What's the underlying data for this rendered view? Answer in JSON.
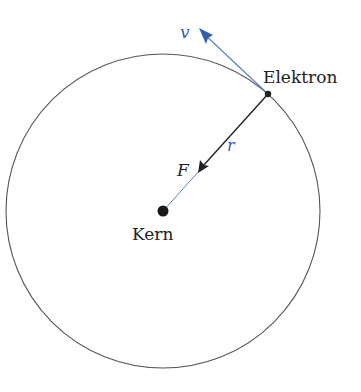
{
  "diagram": {
    "type": "bohr-atom-orbit",
    "labels": {
      "electron": "Elektron",
      "nucleus": "Kern",
      "velocity": "v",
      "radius": "r",
      "force": "F"
    },
    "colors": {
      "orbit": "#555555",
      "vector_blue": "#2f5fb0",
      "dark_line": "#222222",
      "background": "#ffffff"
    }
  }
}
